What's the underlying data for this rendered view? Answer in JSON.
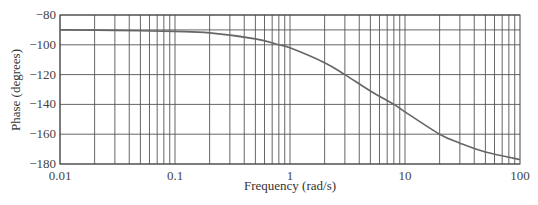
{
  "chart_data": {
    "type": "line",
    "title": "",
    "xlabel": "Frequency (rad/s)",
    "ylabel": "Phase (degrees)",
    "xscale": "log",
    "xlim": [
      0.01,
      100
    ],
    "ylim": [
      -180,
      -80
    ],
    "grid": true,
    "legend": null,
    "x_tick_labels": [
      "0.01",
      "0.1",
      "1",
      "10",
      "100"
    ],
    "y_tick_labels": [
      "-80",
      "-100",
      "-120",
      "-140",
      "-160",
      "-180"
    ],
    "y_ticks": [
      -80,
      -90,
      -100,
      -120,
      -140,
      -160,
      -180
    ],
    "series": [
      {
        "name": "Phase",
        "color": "#666666",
        "x": [
          0.01,
          0.03,
          0.1,
          0.2,
          0.5,
          0.8,
          1,
          2,
          3,
          5,
          8,
          10,
          20,
          30,
          50,
          100
        ],
        "values": [
          -90,
          -90.3,
          -91,
          -92,
          -96,
          -100,
          -102,
          -112,
          -120,
          -131,
          -140,
          -145,
          -160,
          -166,
          -172,
          -177
        ]
      }
    ]
  }
}
